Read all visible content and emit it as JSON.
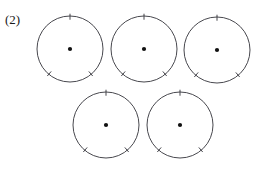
{
  "figure": {
    "label": "(2)",
    "background_color": "#ffffff",
    "stroke_color": "#33333a",
    "dot_color": "#111111"
  },
  "chart_data": {
    "type": "diagram",
    "title": "(2)",
    "xlabel": "",
    "ylabel": "",
    "grid": false,
    "legend": "none",
    "units": "pixels",
    "canvas": {
      "width": 262,
      "height": 171
    },
    "shape_kind": "circle-with-radial-ticks",
    "tick_angles_deg_clockwise_from_top": [
      0,
      140,
      220
    ],
    "ticks_per_circle": 3,
    "circle_count": 5,
    "rows": [
      {
        "row": 1,
        "count": 3
      },
      {
        "row": 2,
        "count": 2
      }
    ],
    "categories": [
      "circle-1",
      "circle-2",
      "circle-3",
      "circle-4",
      "circle-5"
    ],
    "values": [
      3,
      3,
      3,
      3,
      3
    ],
    "circles": [
      {
        "id": "circle-1",
        "row": 1,
        "index": 1,
        "cx": 70,
        "cy": 49,
        "r": 33,
        "dot_r": 2.1,
        "tick_len": 6,
        "ticks_deg": [
          0,
          140,
          220
        ]
      },
      {
        "id": "circle-2",
        "row": 1,
        "index": 2,
        "cx": 144,
        "cy": 49,
        "r": 33,
        "dot_r": 2.1,
        "tick_len": 6,
        "ticks_deg": [
          0,
          140,
          220
        ]
      },
      {
        "id": "circle-3",
        "row": 1,
        "index": 3,
        "cx": 217,
        "cy": 50,
        "r": 33,
        "dot_r": 2.1,
        "tick_len": 6,
        "ticks_deg": [
          0,
          140,
          220
        ]
      },
      {
        "id": "circle-4",
        "row": 2,
        "index": 1,
        "cx": 106,
        "cy": 125,
        "r": 33,
        "dot_r": 2.1,
        "tick_len": 6,
        "ticks_deg": [
          0,
          140,
          220
        ]
      },
      {
        "id": "circle-5",
        "row": 2,
        "index": 2,
        "cx": 180,
        "cy": 125,
        "r": 33,
        "dot_r": 2.1,
        "tick_len": 6,
        "ticks_deg": [
          0,
          140,
          220
        ]
      }
    ]
  }
}
